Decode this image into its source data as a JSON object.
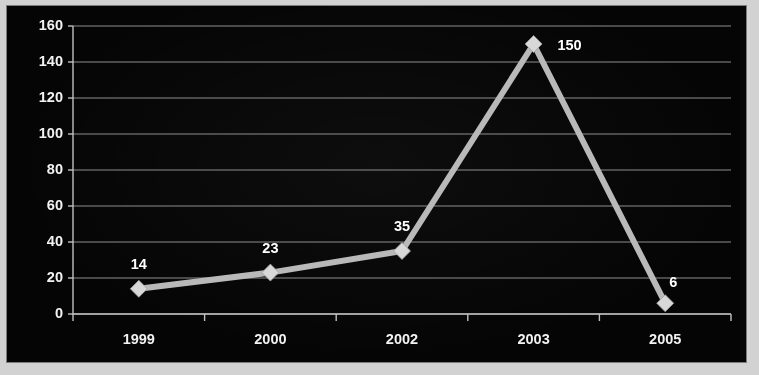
{
  "chart_data": {
    "type": "line",
    "title": "",
    "subtitle": "",
    "xlabel": "",
    "ylabel": "",
    "categories": [
      "1999",
      "2000",
      "2002",
      "2003",
      "2005"
    ],
    "values": [
      14,
      23,
      35,
      150,
      6
    ],
    "data_labels": [
      "14",
      "23",
      "35",
      "150",
      "6"
    ],
    "series": [
      {
        "name": "Series 1",
        "values": [
          14,
          23,
          35,
          150,
          6
        ]
      }
    ],
    "ylim": [
      0,
      160
    ],
    "ytick_step": 20,
    "ytick_labels": [
      "160",
      "140",
      "120",
      "100",
      "80",
      "60",
      "40",
      "20",
      "0"
    ],
    "ytick_values": [
      160,
      140,
      120,
      100,
      80,
      60,
      40,
      20,
      0
    ],
    "grid": true,
    "grid_axis": "y",
    "legend": false,
    "legend_position": "none",
    "marker": "diamond",
    "colors": {
      "background": "#050505",
      "page": "#d2d2d2",
      "line": "#b9b9b9",
      "marker": "#d8d8d8",
      "grid": "#8e8e8e",
      "axis": "#c0c0c0",
      "text": "#f2f2f2",
      "data_label": "#ffffff"
    }
  }
}
